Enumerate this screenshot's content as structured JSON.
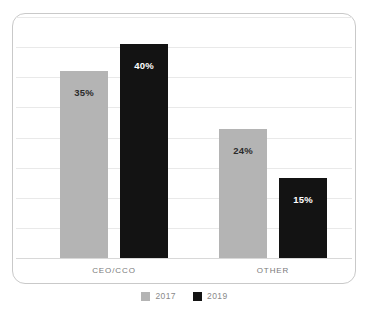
{
  "chart_data": {
    "type": "bar",
    "title": "",
    "subtitle": "",
    "xlabel": "",
    "ylabel": "",
    "categories": [
      "CEO/CCO",
      "OTHER"
    ],
    "series": [
      {
        "name": "2017",
        "color": "#b4b4b4",
        "values": [
          35,
          24
        ],
        "labels": [
          "35%",
          "24%"
        ],
        "label_color": "#2b2b2b"
      },
      {
        "name": "2019",
        "color": "#131313",
        "values": [
          40,
          15
        ],
        "labels": [
          "40%",
          "15%"
        ],
        "label_color": "#ffffff"
      }
    ],
    "value_suffix": "%",
    "ylim": [
      0,
      45
    ],
    "grid": true,
    "gridline_count": 8,
    "gridline_color": "#e9e9e9",
    "legend_position": "bottom",
    "legend": [
      {
        "label": "2017",
        "swatch": "legend-swatch-2017",
        "color": "#b4b4b4"
      },
      {
        "label": "2019",
        "swatch": "legend-swatch-2019",
        "color": "#131313"
      }
    ]
  },
  "card": {
    "background": "#ffffff",
    "border_color": "#c9c9c9"
  }
}
